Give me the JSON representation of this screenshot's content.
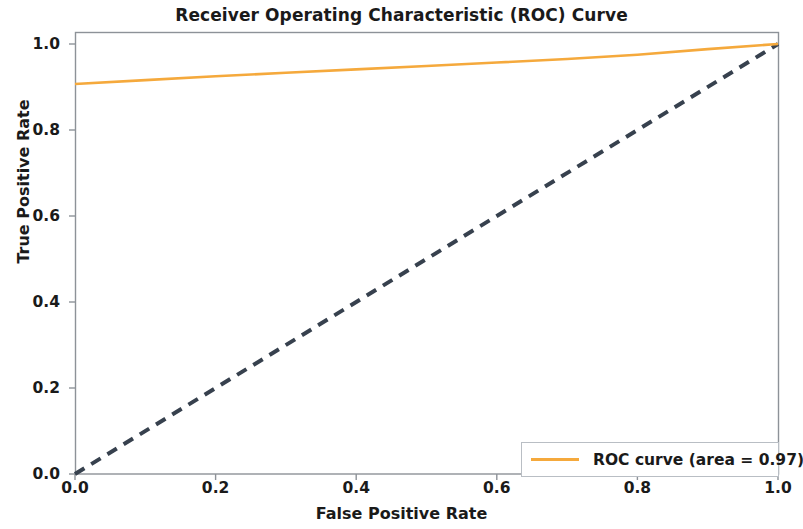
{
  "chart_data": {
    "type": "line",
    "title": "Receiver Operating Characteristic (ROC) Curve",
    "xlabel": "False Positive Rate",
    "ylabel": "True Positive Rate",
    "xlim": [
      0.0,
      1.0
    ],
    "ylim": [
      0.0,
      1.0
    ],
    "grid": false,
    "legend_position": "lower right",
    "xticks": [
      "0.0",
      "0.2",
      "0.4",
      "0.6",
      "0.8",
      "1.0"
    ],
    "xtick_values": [
      0.0,
      0.2,
      0.4,
      0.6,
      0.8,
      1.0
    ],
    "yticks": [
      "0.0",
      "0.2",
      "0.4",
      "0.6",
      "0.8",
      "1.0"
    ],
    "ytick_values": [
      0.0,
      0.2,
      0.4,
      0.6,
      0.8,
      1.0
    ],
    "series": [
      {
        "name": "ROC curve (area = 0.97)",
        "color": "#f5a93c",
        "linestyle": "solid",
        "linewidth": 2.0,
        "auc": 0.97,
        "x": [
          0.0,
          0.1,
          0.2,
          0.3,
          0.4,
          0.5,
          0.6,
          0.7,
          0.8,
          0.9,
          1.0
        ],
        "y": [
          0.907,
          0.916,
          0.925,
          0.933,
          0.941,
          0.949,
          0.957,
          0.965,
          0.975,
          0.988,
          1.0
        ]
      },
      {
        "name": "chance-level-diagonal",
        "color": "#37414e",
        "linestyle": "dashed",
        "linewidth": 3.0,
        "x": [
          0.0,
          1.0
        ],
        "y": [
          0.0,
          1.0
        ]
      }
    ]
  },
  "legend": {
    "entries": [
      {
        "label": "ROC curve (area = 0.97)",
        "color": "#f5a93c"
      }
    ]
  },
  "colors": {
    "roc_curve": "#f5a93c",
    "diagonal": "#37414e",
    "axis": "#8d9298",
    "text": "#1a1a1a",
    "background": "#ffffff"
  }
}
